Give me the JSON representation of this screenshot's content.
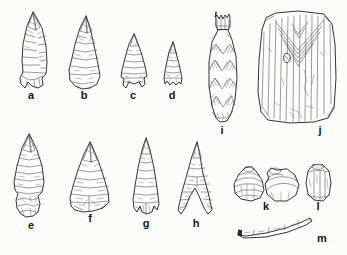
{
  "plate": {
    "kind": "archaeological-artifact-plate",
    "style": "ink line drawing",
    "background_color": "#fbfbf9",
    "ink_color": "#1d1d20",
    "label_color": "#16161a",
    "item_count": 13,
    "rows": 3
  },
  "items": [
    {
      "id": "a",
      "label": "a",
      "name": "corner-notched-projectile-point",
      "category": "chipped stone projectile point",
      "label_x": 31,
      "label_y": 95,
      "x": 18,
      "y": 12,
      "w": 34,
      "h": 78
    },
    {
      "id": "b",
      "label": "b",
      "name": "triangular-stemmed-projectile-point",
      "category": "chipped stone projectile point",
      "label_x": 84,
      "label_y": 95,
      "x": 67,
      "y": 16,
      "w": 36,
      "h": 74
    },
    {
      "id": "c",
      "label": "c",
      "name": "small-side-notched-projectile-point",
      "category": "chipped stone projectile point",
      "label_x": 133,
      "label_y": 95,
      "x": 119,
      "y": 34,
      "w": 29,
      "h": 56
    },
    {
      "id": "d",
      "label": "d",
      "name": "small-triangular-projectile-point",
      "category": "chipped stone projectile point",
      "label_x": 172,
      "label_y": 95,
      "x": 161,
      "y": 42,
      "w": 22,
      "h": 48
    },
    {
      "id": "e",
      "label": "e",
      "name": "large-stemmed-projectile-point",
      "category": "chipped stone projectile point",
      "label_x": 31,
      "label_y": 225,
      "x": 10,
      "y": 134,
      "w": 40,
      "h": 84
    },
    {
      "id": "f",
      "label": "f",
      "name": "broad-triangular-projectile-point",
      "category": "chipped stone projectile point",
      "label_x": 90,
      "label_y": 218,
      "x": 67,
      "y": 142,
      "w": 44,
      "h": 70
    },
    {
      "id": "g",
      "label": "g",
      "name": "narrow-lanceolate-projectile-point",
      "category": "chipped stone projectile point",
      "label_x": 146,
      "label_y": 223,
      "x": 129,
      "y": 138,
      "w": 32,
      "h": 78
    },
    {
      "id": "h",
      "label": "h",
      "name": "basal-notched-triangular-point",
      "category": "chipped stone projectile point",
      "label_x": 196,
      "label_y": 223,
      "x": 176,
      "y": 142,
      "w": 38,
      "h": 75
    },
    {
      "id": "i",
      "label": "i",
      "name": "decorated-elongated-vessel",
      "category": "ceramic vessel with zigzag decoration",
      "label_x": 222,
      "label_y": 130,
      "x": 205,
      "y": 10,
      "w": 34,
      "h": 112
    },
    {
      "id": "j",
      "label": "j",
      "name": "incised-rectangular-tablet",
      "category": "incised tablet with chevron motif",
      "label_x": 320,
      "label_y": 130,
      "x": 256,
      "y": 10,
      "w": 82,
      "h": 112
    },
    {
      "id": "k",
      "label": "k",
      "name": "globular-bead-two-views",
      "category": "shell or stone bead, two views",
      "label_x": 266,
      "label_y": 206,
      "x": 232,
      "y": 166,
      "w": 68,
      "h": 36
    },
    {
      "id": "l",
      "label": "l",
      "name": "barrel-shaped-bead",
      "category": "barrel-shaped bead",
      "label_x": 318,
      "label_y": 206,
      "x": 304,
      "y": 163,
      "w": 28,
      "h": 38
    },
    {
      "id": "m",
      "label": "m",
      "name": "tubular-bone-bead",
      "category": "tubular bone bead",
      "label_x": 322,
      "label_y": 238,
      "x": 238,
      "y": 218,
      "w": 76,
      "h": 18
    }
  ]
}
